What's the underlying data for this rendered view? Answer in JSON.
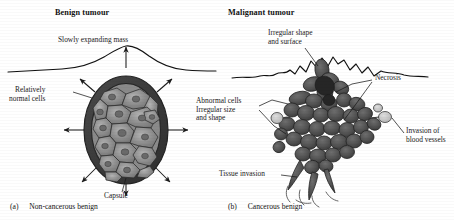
{
  "figure": {
    "style": "grayscale-textbook-diagram",
    "colors": {
      "ink": "#1a1a1a",
      "capsule_dark": "#3b3b3b",
      "cell_fill": "#8d8d8d",
      "cell_stroke": "#2e2e2e",
      "mass_dark": "#545454",
      "vessel_light": "#c9c9c9",
      "background": "#ffffff"
    }
  },
  "panels": [
    {
      "id": "benign",
      "title": "Benign tumour",
      "caption_tag": "(a)",
      "caption_text": "Non-cancerous benign",
      "labels": [
        {
          "name": "slowly-expanding-mass",
          "text": "Slowly expanding mass"
        },
        {
          "name": "relatively-normal-cells",
          "text": "Relatively\nnormal cells"
        },
        {
          "name": "capsule",
          "text": "Capsule"
        }
      ]
    },
    {
      "id": "malignant",
      "title": "Malignant tumour",
      "caption_tag": "(b)",
      "caption_text": "Cancerous benign",
      "labels": [
        {
          "name": "irregular-shape-and-surface",
          "text": "Irregular shape\nand surface"
        },
        {
          "name": "necrosis",
          "text": "Necrosis"
        },
        {
          "name": "abnormal-cells",
          "text": "Abnormal cells\nIrregular size\nand shape"
        },
        {
          "name": "invasion-of-blood-vessels",
          "text": "Invasion of\nblood vessels"
        },
        {
          "name": "tissue-invasion",
          "text": "Tissue invasion"
        }
      ]
    }
  ]
}
